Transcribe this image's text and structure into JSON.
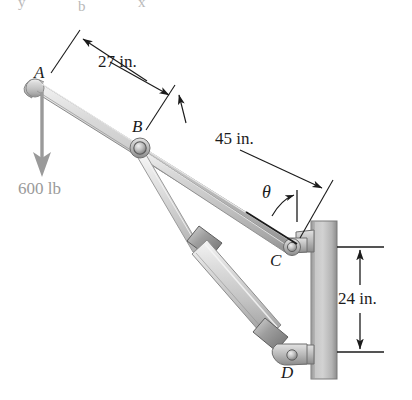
{
  "figure": {
    "type": "engineering-mechanics-diagram",
    "background_color": "#ffffff",
    "ink_color": "#1b1b1b",
    "load_color": "#9a9a9a",
    "metal_color": "#c9c9c9",
    "wall_color": "#b6b6b6"
  },
  "points": [
    {
      "id": "A",
      "label": "A",
      "x": 42,
      "y": 73,
      "note": "free end of boom where load is applied"
    },
    {
      "id": "B",
      "label": "B",
      "x": 139,
      "y": 127,
      "note": "pin joint on boom, hydraulic rod attaches"
    },
    {
      "id": "C",
      "label": "C",
      "x": 294,
      "y": 243,
      "note": "boom pinned to wall bracket"
    },
    {
      "id": "D",
      "label": "D",
      "x": 289,
      "y": 371,
      "note": "hydraulic cylinder base pinned to wall"
    }
  ],
  "dimensions": [
    {
      "id": "dim-27",
      "label": "27 in.",
      "value": 27,
      "unit": "in.",
      "from": "A",
      "to": "B",
      "x": 96,
      "y": 63
    },
    {
      "id": "dim-45",
      "label": "45 in.",
      "value": 45,
      "unit": "in.",
      "from": "B",
      "to": "C",
      "x": 207,
      "y": 139
    },
    {
      "id": "dim-24",
      "label": "24 in.",
      "value": 24,
      "unit": "in.",
      "from": "C",
      "to": "D",
      "x": 355,
      "y": 298
    }
  ],
  "angle": {
    "id": "theta",
    "label": "θ",
    "x": 269,
    "y": 191,
    "note": "angle between boom AC and the vertical reference line at C"
  },
  "load": {
    "id": "load-600",
    "label": "600 lb",
    "value": 600,
    "unit": "lb",
    "direction": "down",
    "applied_at": "A",
    "x": 20,
    "y": 188,
    "color": "#9a9a9a"
  },
  "artifacts": {
    "top_fragment_left": "y",
    "top_fragment_mid": "b",
    "top_fragment_right": "x"
  }
}
